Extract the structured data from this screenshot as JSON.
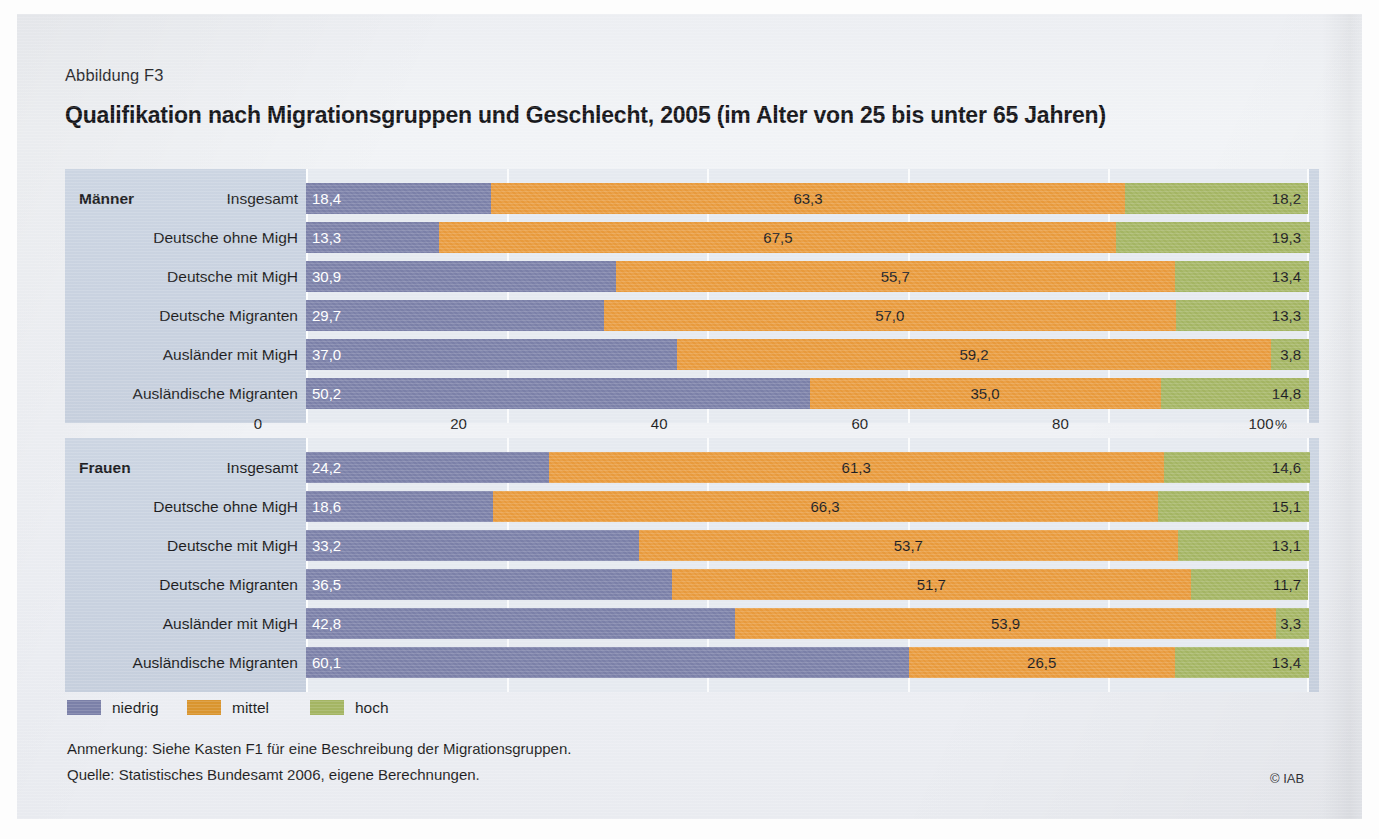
{
  "figure": {
    "number": "Abbildung F3",
    "title": "Qualifikation nach Migrationsgruppen und Geschlecht, 2005 (im Alter von 25 bis unter 65 Jahren)",
    "note": "Anmerkung: Siehe Kasten F1 für eine Beschreibung der Migrationsgruppen.",
    "source": "Quelle: Statistisches Bundesamt 2006, eigene Berechnungen.",
    "copyright": "© IAB"
  },
  "legend": {
    "position": "bottom-left",
    "items": [
      {
        "label": "niedrig",
        "color": "#7b80a8"
      },
      {
        "label": "mittel",
        "color": "#d9952f"
      },
      {
        "label": "hoch",
        "color": "#a4b563"
      }
    ]
  },
  "axis": {
    "ticks": [
      "0",
      "20",
      "40",
      "60",
      "80",
      "100"
    ],
    "unit": "%",
    "min": 0,
    "max": 100
  },
  "chart_data": {
    "type": "bar",
    "orientation": "horizontal",
    "stacked": true,
    "title": "Qualifikation nach Migrationsgruppen und Geschlecht, 2005 (im Alter von 25 bis unter 65 Jahren)",
    "xlabel": "%",
    "ylabel": "",
    "xlim": [
      0,
      100
    ],
    "grid": true,
    "series_names": [
      "niedrig",
      "mittel",
      "hoch"
    ],
    "series_colors": [
      "#7b80a8",
      "#e89a3c",
      "#a4b563"
    ],
    "panels": [
      {
        "group": "Männer",
        "categories": [
          "Insgesamt",
          "Deutsche ohne MigH",
          "Deutsche mit MigH",
          "Deutsche Migranten",
          "Ausländer mit MigH",
          "Ausländische Migranten"
        ],
        "rows": [
          {
            "category": "Insgesamt",
            "niedrig": 18.4,
            "mittel": 63.3,
            "hoch": 18.2,
            "labels": {
              "niedrig": "18,4",
              "mittel": "63,3",
              "hoch": "18,2"
            }
          },
          {
            "category": "Deutsche ohne MigH",
            "niedrig": 13.3,
            "mittel": 67.5,
            "hoch": 19.3,
            "labels": {
              "niedrig": "13,3",
              "mittel": "67,5",
              "hoch": "19,3"
            }
          },
          {
            "category": "Deutsche mit MigH",
            "niedrig": 30.9,
            "mittel": 55.7,
            "hoch": 13.4,
            "labels": {
              "niedrig": "30,9",
              "mittel": "55,7",
              "hoch": "13,4"
            }
          },
          {
            "category": "Deutsche Migranten",
            "niedrig": 29.7,
            "mittel": 57.0,
            "hoch": 13.3,
            "labels": {
              "niedrig": "29,7",
              "mittel": "57,0",
              "hoch": "13,3"
            }
          },
          {
            "category": "Ausländer mit MigH",
            "niedrig": 37.0,
            "mittel": 59.2,
            "hoch": 3.8,
            "labels": {
              "niedrig": "37,0",
              "mittel": "59,2",
              "hoch": "3,8"
            }
          },
          {
            "category": "Ausländische Migranten",
            "niedrig": 50.2,
            "mittel": 35.0,
            "hoch": 14.8,
            "labels": {
              "niedrig": "50,2",
              "mittel": "35,0",
              "hoch": "14,8"
            }
          }
        ]
      },
      {
        "group": "Frauen",
        "categories": [
          "Insgesamt",
          "Deutsche ohne MigH",
          "Deutsche mit MigH",
          "Deutsche Migranten",
          "Ausländer mit MigH",
          "Ausländische Migranten"
        ],
        "rows": [
          {
            "category": "Insgesamt",
            "niedrig": 24.2,
            "mittel": 61.3,
            "hoch": 14.6,
            "labels": {
              "niedrig": "24,2",
              "mittel": "61,3",
              "hoch": "14,6"
            }
          },
          {
            "category": "Deutsche ohne MigH",
            "niedrig": 18.6,
            "mittel": 66.3,
            "hoch": 15.1,
            "labels": {
              "niedrig": "18,6",
              "mittel": "66,3",
              "hoch": "15,1"
            }
          },
          {
            "category": "Deutsche mit MigH",
            "niedrig": 33.2,
            "mittel": 53.7,
            "hoch": 13.1,
            "labels": {
              "niedrig": "33,2",
              "mittel": "53,7",
              "hoch": "13,1"
            }
          },
          {
            "category": "Deutsche Migranten",
            "niedrig": 36.5,
            "mittel": 51.7,
            "hoch": 11.7,
            "labels": {
              "niedrig": "36,5",
              "mittel": "51,7",
              "hoch": "11,7"
            }
          },
          {
            "category": "Ausländer mit MigH",
            "niedrig": 42.8,
            "mittel": 53.9,
            "hoch": 3.3,
            "labels": {
              "niedrig": "42,8",
              "mittel": "53,9",
              "hoch": "3,3"
            }
          },
          {
            "category": "Ausländische Migranten",
            "niedrig": 60.1,
            "mittel": 26.5,
            "hoch": 13.4,
            "labels": {
              "niedrig": "60,1",
              "mittel": "26,5",
              "hoch": "13,4"
            }
          }
        ]
      }
    ]
  }
}
